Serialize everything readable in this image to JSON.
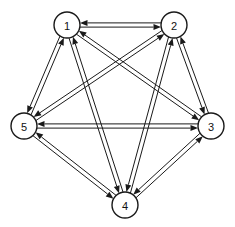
{
  "figure": {
    "kind": "directed-graph-diagram",
    "width": 235,
    "height": 227,
    "background_color": "#ffffff",
    "line_color": "#1a1a1a",
    "node_fill_color": "#ffffff",
    "label_color": "#111111"
  },
  "graph": {
    "type": "directed",
    "complete": true,
    "node_count": 5,
    "directed_edge_count": 20,
    "undirected_pair_count": 10,
    "node_radius": 13,
    "nodes": [
      {
        "id": "1",
        "label": "1",
        "x": 67,
        "y": 25
      },
      {
        "id": "2",
        "label": "2",
        "x": 174,
        "y": 25
      },
      {
        "id": "3",
        "label": "3",
        "x": 211,
        "y": 126
      },
      {
        "id": "4",
        "label": "4",
        "x": 125,
        "y": 205
      },
      {
        "id": "5",
        "label": "5",
        "x": 24,
        "y": 126
      }
    ],
    "pairs": [
      {
        "a": "1",
        "b": "2",
        "bidirectional": true
      },
      {
        "a": "1",
        "b": "3",
        "bidirectional": true
      },
      {
        "a": "1",
        "b": "4",
        "bidirectional": true
      },
      {
        "a": "1",
        "b": "5",
        "bidirectional": true
      },
      {
        "a": "2",
        "b": "3",
        "bidirectional": true
      },
      {
        "a": "2",
        "b": "4",
        "bidirectional": true
      },
      {
        "a": "2",
        "b": "5",
        "bidirectional": true
      },
      {
        "a": "3",
        "b": "4",
        "bidirectional": true
      },
      {
        "a": "3",
        "b": "5",
        "bidirectional": true
      },
      {
        "a": "4",
        "b": "5",
        "bidirectional": true
      }
    ],
    "directed_edges": [
      {
        "from": "1",
        "to": "2"
      },
      {
        "from": "2",
        "to": "1"
      },
      {
        "from": "1",
        "to": "3"
      },
      {
        "from": "3",
        "to": "1"
      },
      {
        "from": "1",
        "to": "4"
      },
      {
        "from": "4",
        "to": "1"
      },
      {
        "from": "1",
        "to": "5"
      },
      {
        "from": "5",
        "to": "1"
      },
      {
        "from": "2",
        "to": "3"
      },
      {
        "from": "3",
        "to": "2"
      },
      {
        "from": "2",
        "to": "4"
      },
      {
        "from": "4",
        "to": "2"
      },
      {
        "from": "2",
        "to": "5"
      },
      {
        "from": "5",
        "to": "2"
      },
      {
        "from": "3",
        "to": "4"
      },
      {
        "from": "4",
        "to": "3"
      },
      {
        "from": "3",
        "to": "5"
      },
      {
        "from": "5",
        "to": "3"
      },
      {
        "from": "4",
        "to": "5"
      },
      {
        "from": "5",
        "to": "4"
      }
    ]
  }
}
